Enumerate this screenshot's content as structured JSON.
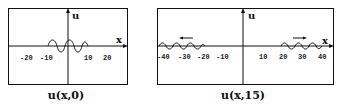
{
  "panels": [
    {
      "caption": "u(x,0)",
      "y_label": "u",
      "x_label": "x",
      "ticks": [
        "-20",
        "-10",
        "10",
        "20"
      ],
      "tick_values": [
        -20,
        -10,
        10,
        20
      ],
      "description": "Initial wave packet centered near x=0, spanning roughly -10 to 10"
    },
    {
      "caption": "u(x,15)",
      "y_label": "u",
      "x_label": "x",
      "ticks": [
        "-40",
        "-30",
        "-20",
        "-10",
        "10",
        "20",
        "30",
        "40"
      ],
      "tick_values": [
        -40,
        -30,
        -20,
        -10,
        10,
        20,
        30,
        40
      ],
      "arrows": [
        "←",
        "→"
      ],
      "description": "Two wave packets traveling outward: left packet near x=-30 moving left, right packet near x=30 moving right"
    }
  ],
  "colors": {
    "line": "#111111",
    "background": "#ffffff"
  }
}
